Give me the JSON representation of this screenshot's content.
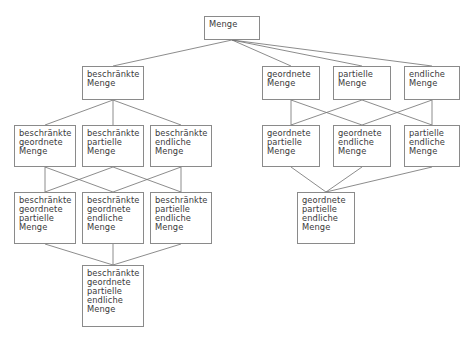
{
  "diagram": {
    "language": "de",
    "background_color": "#ffffff",
    "box_border_color": "#8a8a8a",
    "box_fill_color": "#ffffff",
    "text_color": "#3a3a3a",
    "edge_color": "#6e6e6e",
    "nodes": [
      {
        "id": "menge",
        "label": "Menge",
        "x": 204,
        "y": 16,
        "w": 56,
        "h": 24
      },
      {
        "id": "beschraenkte",
        "label": "beschränkte\nMenge",
        "x": 82,
        "y": 66,
        "w": 62,
        "h": 34
      },
      {
        "id": "geordnete",
        "label": "geordnete\nMenge",
        "x": 262,
        "y": 66,
        "w": 58,
        "h": 34
      },
      {
        "id": "partielle",
        "label": "partielle\nMenge",
        "x": 333,
        "y": 66,
        "w": 58,
        "h": 34
      },
      {
        "id": "endliche",
        "label": "endliche\nMenge",
        "x": 404,
        "y": 66,
        "w": 56,
        "h": 34
      },
      {
        "id": "b-geordnete",
        "label": "beschränkte\ngeordnete\nMenge",
        "x": 14,
        "y": 125,
        "w": 62,
        "h": 42
      },
      {
        "id": "b-partielle",
        "label": "beschränkte\npartielle\nMenge",
        "x": 82,
        "y": 125,
        "w": 62,
        "h": 42
      },
      {
        "id": "b-endliche",
        "label": "beschränkte\nendliche\nMenge",
        "x": 150,
        "y": 125,
        "w": 62,
        "h": 42
      },
      {
        "id": "g-partielle",
        "label": "geordnete\npartielle\nMenge",
        "x": 262,
        "y": 125,
        "w": 58,
        "h": 42
      },
      {
        "id": "g-endliche",
        "label": "geordnete\nendliche\nMenge",
        "x": 333,
        "y": 125,
        "w": 58,
        "h": 42
      },
      {
        "id": "p-endliche",
        "label": "partielle\nendliche\nMenge",
        "x": 404,
        "y": 125,
        "w": 56,
        "h": 42
      },
      {
        "id": "b-g-partielle",
        "label": "beschränkte\ngeordnete\npartielle\nMenge",
        "x": 14,
        "y": 192,
        "w": 62,
        "h": 52
      },
      {
        "id": "b-g-endliche",
        "label": "beschränkte\ngeordnete\nendliche\nMenge",
        "x": 82,
        "y": 192,
        "w": 62,
        "h": 52
      },
      {
        "id": "b-p-endliche",
        "label": "beschränkte\npartielle\nendliche\nMenge",
        "x": 150,
        "y": 192,
        "w": 62,
        "h": 52
      },
      {
        "id": "g-p-endliche",
        "label": "geordnete\npartielle\nendliche\nMenge",
        "x": 297,
        "y": 192,
        "w": 58,
        "h": 52
      },
      {
        "id": "b-g-p-endliche",
        "label": "beschränkte\ngeordnete\npartielle\nendliche\nMenge",
        "x": 82,
        "y": 265,
        "w": 62,
        "h": 62
      }
    ],
    "edges": [
      {
        "from": "menge",
        "to": "beschraenkte"
      },
      {
        "from": "menge",
        "to": "geordnete"
      },
      {
        "from": "menge",
        "to": "partielle"
      },
      {
        "from": "menge",
        "to": "endliche"
      },
      {
        "from": "beschraenkte",
        "to": "b-geordnete"
      },
      {
        "from": "beschraenkte",
        "to": "b-partielle"
      },
      {
        "from": "beschraenkte",
        "to": "b-endliche"
      },
      {
        "from": "geordnete",
        "to": "g-partielle"
      },
      {
        "from": "geordnete",
        "to": "g-endliche"
      },
      {
        "from": "partielle",
        "to": "g-partielle"
      },
      {
        "from": "partielle",
        "to": "p-endliche"
      },
      {
        "from": "endliche",
        "to": "g-endliche"
      },
      {
        "from": "endliche",
        "to": "p-endliche"
      },
      {
        "from": "b-geordnete",
        "to": "b-g-partielle"
      },
      {
        "from": "b-geordnete",
        "to": "b-g-endliche"
      },
      {
        "from": "b-partielle",
        "to": "b-g-partielle"
      },
      {
        "from": "b-partielle",
        "to": "b-p-endliche"
      },
      {
        "from": "b-endliche",
        "to": "b-g-endliche"
      },
      {
        "from": "b-endliche",
        "to": "b-p-endliche"
      },
      {
        "from": "g-partielle",
        "to": "g-p-endliche"
      },
      {
        "from": "g-endliche",
        "to": "g-p-endliche"
      },
      {
        "from": "p-endliche",
        "to": "g-p-endliche"
      },
      {
        "from": "b-g-partielle",
        "to": "b-g-p-endliche"
      },
      {
        "from": "b-g-endliche",
        "to": "b-g-p-endliche"
      },
      {
        "from": "b-p-endliche",
        "to": "b-g-p-endliche"
      }
    ]
  }
}
